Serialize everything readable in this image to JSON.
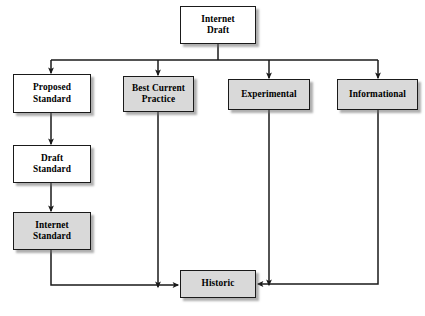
{
  "diagram": {
    "type": "flowchart",
    "canvas": {
      "width": 425,
      "height": 316,
      "background": "#ffffff"
    },
    "style": {
      "box_fill_white": "#ffffff",
      "box_fill_gray": "#d9d9d9",
      "box_border": "#1a1a1a",
      "line_color": "#1a1a1a",
      "shadow_color": "#6e6e6e"
    },
    "nodes": [
      {
        "id": "internet-draft",
        "label": "Internet\nDraft",
        "line1": "Internet",
        "line2": "Draft",
        "fill": "white",
        "x": 180,
        "y": 6,
        "w": 76,
        "h": 38
      },
      {
        "id": "proposed-standard",
        "label": "Proposed\nStandard",
        "line1": "Proposed",
        "line2": "Standard",
        "fill": "white",
        "x": 13,
        "y": 74,
        "w": 78,
        "h": 39
      },
      {
        "id": "best-current-practice",
        "label": "Best Current\nPractice",
        "line1": "Best Current",
        "line2": "Practice",
        "fill": "gray",
        "x": 123,
        "y": 76,
        "w": 71,
        "h": 36
      },
      {
        "id": "experimental",
        "label": "Experimental",
        "line1": "Experimental",
        "line2": "",
        "fill": "gray",
        "x": 228,
        "y": 79,
        "w": 82,
        "h": 31
      },
      {
        "id": "informational",
        "label": "Informational",
        "line1": "Informational",
        "line2": "",
        "fill": "gray",
        "x": 337,
        "y": 79,
        "w": 81,
        "h": 31
      },
      {
        "id": "draft-standard",
        "label": "Draft\nStandard",
        "line1": "Draft",
        "line2": "Standard",
        "fill": "white",
        "x": 13,
        "y": 145,
        "w": 78,
        "h": 38
      },
      {
        "id": "internet-standard",
        "label": "Internet\nStandard",
        "line1": "Internet",
        "line2": "Standard",
        "fill": "gray",
        "x": 13,
        "y": 212,
        "w": 78,
        "h": 38
      },
      {
        "id": "historic",
        "label": "Historic",
        "line1": "Historic",
        "line2": "",
        "fill": "gray",
        "x": 180,
        "y": 270,
        "w": 76,
        "h": 28
      }
    ],
    "edges": [
      {
        "from": "internet-draft",
        "to": "proposed-standard",
        "style": "bus-down"
      },
      {
        "from": "internet-draft",
        "to": "best-current-practice",
        "style": "bus-down"
      },
      {
        "from": "internet-draft",
        "to": "experimental",
        "style": "bus-down"
      },
      {
        "from": "internet-draft",
        "to": "informational",
        "style": "bus-down"
      },
      {
        "from": "proposed-standard",
        "to": "draft-standard",
        "style": "straight-down"
      },
      {
        "from": "draft-standard",
        "to": "internet-standard",
        "style": "straight-down"
      },
      {
        "from": "internet-standard",
        "to": "historic",
        "style": "down-right"
      },
      {
        "from": "best-current-practice",
        "to": "historic",
        "style": "straight-down"
      },
      {
        "from": "experimental",
        "to": "historic",
        "style": "straight-down"
      },
      {
        "from": "informational",
        "to": "historic",
        "style": "down-left"
      }
    ]
  }
}
